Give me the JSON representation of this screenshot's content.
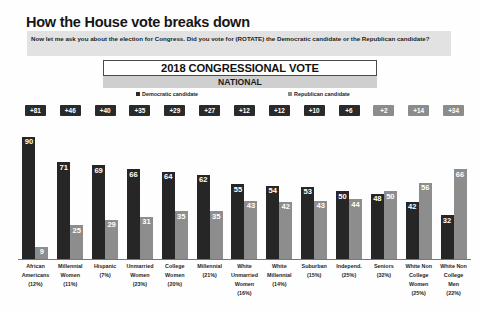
{
  "header": {
    "headline": "How the House vote breaks down",
    "question": "Now let me ask you about the election for Congress. Did you vote for (ROTATE) the Democratic candidate or the Republican candidate?"
  },
  "chart_header": {
    "title": "2018 CONGRESSIONAL VOTE",
    "subtitle": "NATIONAL"
  },
  "legend": {
    "democratic": "Democratic candidate",
    "republican": "Republican candidate"
  },
  "colors": {
    "democratic": "#262626",
    "republican": "#8d8d8d",
    "badge_democratic": "#2a2a2a",
    "badge_republican": "#8c8c8c",
    "question_background": "#e2e2e2",
    "subtitle_background": "#cfcfcf"
  },
  "chart_data": {
    "type": "bar",
    "title": "2018 CONGRESSIONAL VOTE",
    "subtitle": "NATIONAL",
    "xlabel": "",
    "ylabel": "",
    "ylim": [
      0,
      100
    ],
    "grid": false,
    "legend_position": "top",
    "categories": [
      "African Americans (12%)",
      "Millennial Women (11%)",
      "Hispanic (7%)",
      "Unmarried Women (23%)",
      "College Women (20%)",
      "Millennial (21%)",
      "White Unmarried Women (16%)",
      "White Millennial (14%)",
      "Suburban (15%)",
      "Independ. (25%)",
      "Seniors (32%)",
      "White Non College Women (25%)",
      "White Non College Men (22%)"
    ],
    "category_lines": [
      [
        "African",
        "Americans",
        "(12%)"
      ],
      [
        "Millennial",
        "Women",
        "(11%)"
      ],
      [
        "Hispanic",
        "(7%)"
      ],
      [
        "Unmarried",
        "Women",
        "(23%)"
      ],
      [
        "College",
        "Women",
        "(20%)"
      ],
      [
        "Millennial",
        "(21%)"
      ],
      [
        "White",
        "Unmarried",
        "Women",
        "(16%)"
      ],
      [
        "White",
        "Millennial",
        "(14%)"
      ],
      [
        "Suburban",
        "(15%)"
      ],
      [
        "Independ.",
        "(25%)"
      ],
      [
        "Seniors",
        "(32%)"
      ],
      [
        "White Non",
        "College",
        "Women",
        "(25%)"
      ],
      [
        "White Non",
        "College",
        "Men",
        "(22%)"
      ]
    ],
    "series": [
      {
        "name": "Democratic candidate",
        "color": "#262626",
        "values": [
          90,
          71,
          69,
          66,
          64,
          62,
          55,
          54,
          53,
          50,
          48,
          42,
          32
        ]
      },
      {
        "name": "Republican candidate",
        "color": "#8d8d8d",
        "values": [
          9,
          25,
          29,
          31,
          35,
          35,
          43,
          42,
          43,
          44,
          50,
          56,
          66
        ]
      }
    ],
    "margins": [
      {
        "label": "+81",
        "leader": "democratic"
      },
      {
        "label": "+46",
        "leader": "democratic"
      },
      {
        "label": "+40",
        "leader": "democratic"
      },
      {
        "label": "+35",
        "leader": "democratic"
      },
      {
        "label": "+29",
        "leader": "democratic"
      },
      {
        "label": "+27",
        "leader": "democratic"
      },
      {
        "label": "+12",
        "leader": "democratic"
      },
      {
        "label": "+12",
        "leader": "democratic"
      },
      {
        "label": "+10",
        "leader": "democratic"
      },
      {
        "label": "+6",
        "leader": "democratic"
      },
      {
        "label": "+2",
        "leader": "republican"
      },
      {
        "label": "+14",
        "leader": "republican"
      },
      {
        "label": "+34",
        "leader": "republican"
      }
    ]
  }
}
